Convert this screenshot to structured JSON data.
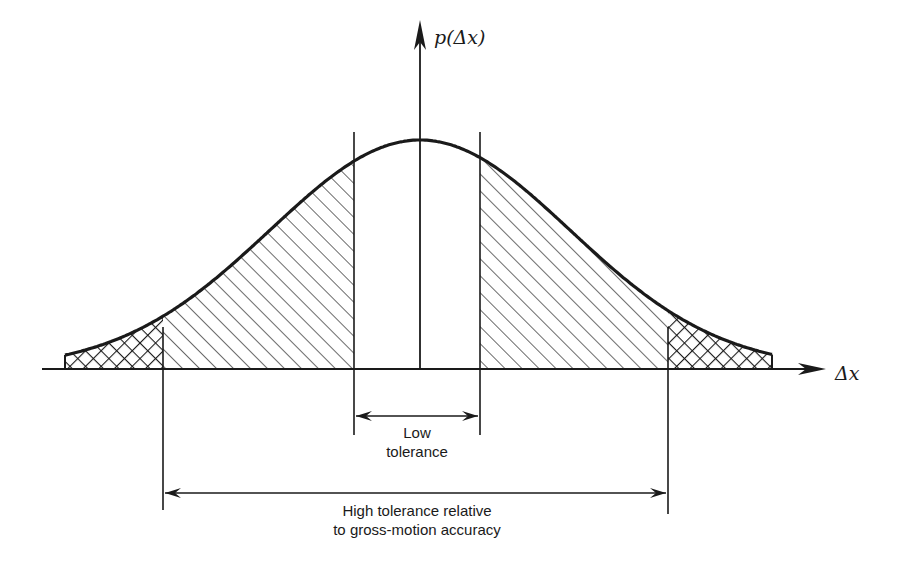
{
  "figure": {
    "y_axis_label": "p(Δx)",
    "x_axis_label": "Δx",
    "low_tolerance_label": [
      "Low",
      "tolerance"
    ],
    "high_tolerance_label": [
      "High tolerance relative",
      "to gross-motion accuracy"
    ],
    "regions": [
      {
        "name": "left-tail",
        "fill": "crosshatch"
      },
      {
        "name": "left-shoulder",
        "fill": "diagonal-hatch"
      },
      {
        "name": "center-low-tolerance",
        "fill": "none"
      },
      {
        "name": "right-shoulder",
        "fill": "diagonal-hatch"
      },
      {
        "name": "right-tail",
        "fill": "crosshatch"
      }
    ],
    "colors": {
      "ink": "#1a1a1a",
      "background": "#ffffff"
    }
  }
}
